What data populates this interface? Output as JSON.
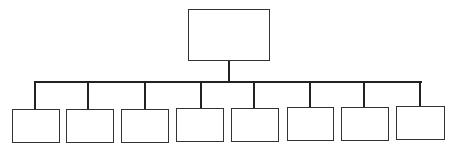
{
  "diagram": {
    "type": "org-chart",
    "root": {
      "label": "",
      "x": 188,
      "y": 9,
      "w": 82,
      "h": 52
    },
    "connector": {
      "trunk_x": 229,
      "trunk_top": 61,
      "bar_y": 82,
      "bar_left": 35,
      "bar_right": 421
    },
    "children": [
      {
        "label": "",
        "x": 12,
        "y": 109,
        "w": 48,
        "h": 34,
        "drop_x": 35
      },
      {
        "label": "",
        "x": 66,
        "y": 109,
        "w": 48,
        "h": 34,
        "drop_x": 88
      },
      {
        "label": "",
        "x": 121,
        "y": 109,
        "w": 48,
        "h": 34,
        "drop_x": 145
      },
      {
        "label": "",
        "x": 176,
        "y": 108,
        "w": 48,
        "h": 34,
        "drop_x": 201
      },
      {
        "label": "",
        "x": 231,
        "y": 108,
        "w": 48,
        "h": 34,
        "drop_x": 254
      },
      {
        "label": "",
        "x": 287,
        "y": 107,
        "w": 47,
        "h": 34,
        "drop_x": 310
      },
      {
        "label": "",
        "x": 341,
        "y": 107,
        "w": 48,
        "h": 34,
        "drop_x": 364
      },
      {
        "label": "",
        "x": 396,
        "y": 106,
        "w": 49,
        "h": 34,
        "drop_x": 420
      }
    ],
    "colors": {
      "line": "#222222",
      "border": "#333333",
      "background": "#ffffff"
    }
  }
}
